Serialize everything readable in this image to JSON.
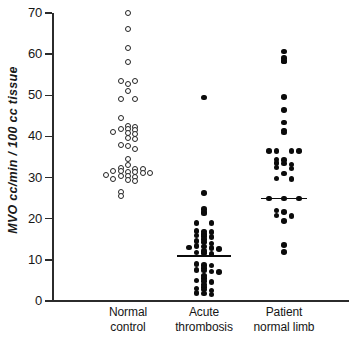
{
  "chart_data": {
    "type": "scatter",
    "subtype": "dot-strip-plot",
    "title": "",
    "xlabel": "",
    "ylabel": "MVO cc/min / 100 cc tissue",
    "ylim": [
      0,
      70
    ],
    "yticks": [
      0,
      10,
      20,
      30,
      40,
      50,
      60,
      70
    ],
    "ytick_labels": [
      "0",
      "10",
      "20",
      "30",
      "40",
      "50",
      "60",
      "70"
    ],
    "grid": false,
    "legend": "none",
    "categories": [
      "Normal control",
      "Acute thrombosis",
      "Patient normal limb"
    ],
    "category_labels": [
      {
        "line1": "Normal",
        "line2": "control"
      },
      {
        "line1": "Acute",
        "line2": "thrombosis"
      },
      {
        "line1": "Patient",
        "line2": "normal limb"
      }
    ],
    "series": [
      {
        "name": "Normal control",
        "marker": "open-circle",
        "marker_color": "#222222",
        "marker_fill": "#ffffff",
        "median_line": false,
        "n": 44,
        "points": [
          {
            "v": 70.0,
            "o": 0
          },
          {
            "v": 66.0,
            "o": 0
          },
          {
            "v": 61.5,
            "o": 0
          },
          {
            "v": 58.0,
            "o": 0
          },
          {
            "v": 53.5,
            "o": -1
          },
          {
            "v": 53.5,
            "o": 1
          },
          {
            "v": 52.8,
            "o": 0
          },
          {
            "v": 51.0,
            "o": 0
          },
          {
            "v": 49.0,
            "o": -1
          },
          {
            "v": 49.0,
            "o": 1
          },
          {
            "v": 44.5,
            "o": -1
          },
          {
            "v": 42.5,
            "o": 0
          },
          {
            "v": 42.3,
            "o": 1
          },
          {
            "v": 41.8,
            "o": -1
          },
          {
            "v": 41.7,
            "o": 0
          },
          {
            "v": 41.6,
            "o": 1
          },
          {
            "v": 41.0,
            "o": -2
          },
          {
            "v": 40.8,
            "o": 0
          },
          {
            "v": 40.6,
            "o": 1
          },
          {
            "v": 39.6,
            "o": 0
          },
          {
            "v": 39.4,
            "o": 1
          },
          {
            "v": 38.0,
            "o": -1
          },
          {
            "v": 37.6,
            "o": 0
          },
          {
            "v": 37.0,
            "o": 1
          },
          {
            "v": 34.6,
            "o": 0
          },
          {
            "v": 33.0,
            "o": 0
          },
          {
            "v": 32.4,
            "o": -1
          },
          {
            "v": 32.2,
            "o": 1
          },
          {
            "v": 32.0,
            "o": 2
          },
          {
            "v": 31.6,
            "o": -2
          },
          {
            "v": 31.5,
            "o": -1
          },
          {
            "v": 31.4,
            "o": 0
          },
          {
            "v": 31.3,
            "o": 1
          },
          {
            "v": 31.2,
            "o": 2
          },
          {
            "v": 31.0,
            "o": 3
          },
          {
            "v": 30.6,
            "o": -3
          },
          {
            "v": 30.4,
            "o": -1
          },
          {
            "v": 30.3,
            "o": 0
          },
          {
            "v": 30.2,
            "o": 1
          },
          {
            "v": 29.6,
            "o": -2
          },
          {
            "v": 29.4,
            "o": 0
          },
          {
            "v": 29.2,
            "o": 1
          },
          {
            "v": 26.5,
            "o": -1
          },
          {
            "v": 25.6,
            "o": -1
          }
        ]
      },
      {
        "name": "Acute thrombosis",
        "marker": "filled-circle",
        "marker_color": "#0b0b0b",
        "median_line": true,
        "median_value": 10.9,
        "n": 48,
        "points": [
          {
            "v": 49.5,
            "o": 0
          },
          {
            "v": 26.2,
            "o": 0
          },
          {
            "v": 22.3,
            "o": 0
          },
          {
            "v": 21.6,
            "o": 0
          },
          {
            "v": 21.3,
            "o": 0
          },
          {
            "v": 19.0,
            "o": 1
          },
          {
            "v": 18.9,
            "o": -1
          },
          {
            "v": 17.0,
            "o": -1
          },
          {
            "v": 16.9,
            "o": 0
          },
          {
            "v": 16.8,
            "o": 1
          },
          {
            "v": 16.3,
            "o": 0
          },
          {
            "v": 15.9,
            "o": -1
          },
          {
            "v": 15.8,
            "o": 0
          },
          {
            "v": 15.6,
            "o": 1
          },
          {
            "v": 15.0,
            "o": 0
          },
          {
            "v": 14.6,
            "o": -1
          },
          {
            "v": 14.4,
            "o": 0
          },
          {
            "v": 14.0,
            "o": 1
          },
          {
            "v": 13.4,
            "o": -1
          },
          {
            "v": 13.2,
            "o": 0
          },
          {
            "v": 13.0,
            "o": -2
          },
          {
            "v": 12.9,
            "o": 1
          },
          {
            "v": 12.6,
            "o": 2
          },
          {
            "v": 12.2,
            "o": 0
          },
          {
            "v": 11.8,
            "o": -1
          },
          {
            "v": 11.6,
            "o": 0
          },
          {
            "v": 11.4,
            "o": 1
          },
          {
            "v": 9.0,
            "o": -1
          },
          {
            "v": 8.8,
            "o": 0
          },
          {
            "v": 8.6,
            "o": 1
          },
          {
            "v": 8.0,
            "o": 0
          },
          {
            "v": 7.6,
            "o": -1
          },
          {
            "v": 7.4,
            "o": 0
          },
          {
            "v": 7.2,
            "o": 1
          },
          {
            "v": 7.0,
            "o": 2
          },
          {
            "v": 6.2,
            "o": 0
          },
          {
            "v": 5.6,
            "o": 0
          },
          {
            "v": 5.0,
            "o": -1
          },
          {
            "v": 4.8,
            "o": 0
          },
          {
            "v": 4.6,
            "o": 1
          },
          {
            "v": 4.0,
            "o": 0
          },
          {
            "v": 3.4,
            "o": 0
          },
          {
            "v": 3.0,
            "o": -1
          },
          {
            "v": 2.8,
            "o": 0
          },
          {
            "v": 2.6,
            "o": 1
          },
          {
            "v": 2.0,
            "o": -1
          },
          {
            "v": 1.8,
            "o": 0
          },
          {
            "v": 1.6,
            "o": 1
          }
        ]
      },
      {
        "name": "Patient normal limb",
        "marker": "filled-circle",
        "marker_color": "#0b0b0b",
        "median_line": true,
        "median_value": 24.9,
        "n": 33,
        "points": [
          {
            "v": 60.6,
            "o": 0
          },
          {
            "v": 59.0,
            "o": 0
          },
          {
            "v": 58.4,
            "o": 0
          },
          {
            "v": 58.2,
            "o": 0
          },
          {
            "v": 49.6,
            "o": 0
          },
          {
            "v": 46.4,
            "o": 0
          },
          {
            "v": 43.4,
            "o": 0
          },
          {
            "v": 41.4,
            "o": 0
          },
          {
            "v": 41.0,
            "o": 0
          },
          {
            "v": 36.4,
            "o": -2
          },
          {
            "v": 36.4,
            "o": -1
          },
          {
            "v": 36.4,
            "o": 1
          },
          {
            "v": 36.4,
            "o": 2
          },
          {
            "v": 34.4,
            "o": -1
          },
          {
            "v": 34.2,
            "o": 0
          },
          {
            "v": 33.6,
            "o": -1
          },
          {
            "v": 33.4,
            "o": 0
          },
          {
            "v": 33.2,
            "o": 1
          },
          {
            "v": 32.4,
            "o": -1
          },
          {
            "v": 32.2,
            "o": 1
          },
          {
            "v": 31.0,
            "o": 0
          },
          {
            "v": 29.8,
            "o": -1
          },
          {
            "v": 29.6,
            "o": 1
          },
          {
            "v": 24.9,
            "o": -2
          },
          {
            "v": 24.9,
            "o": 0
          },
          {
            "v": 24.9,
            "o": 2
          },
          {
            "v": 22.0,
            "o": -1
          },
          {
            "v": 21.6,
            "o": 0
          },
          {
            "v": 20.8,
            "o": -1
          },
          {
            "v": 20.6,
            "o": 1
          },
          {
            "v": 19.4,
            "o": 0
          },
          {
            "v": 13.6,
            "o": 0
          },
          {
            "v": 11.9,
            "o": 0
          }
        ]
      }
    ]
  },
  "axis": {
    "line_color": "#2b2b2b"
  }
}
